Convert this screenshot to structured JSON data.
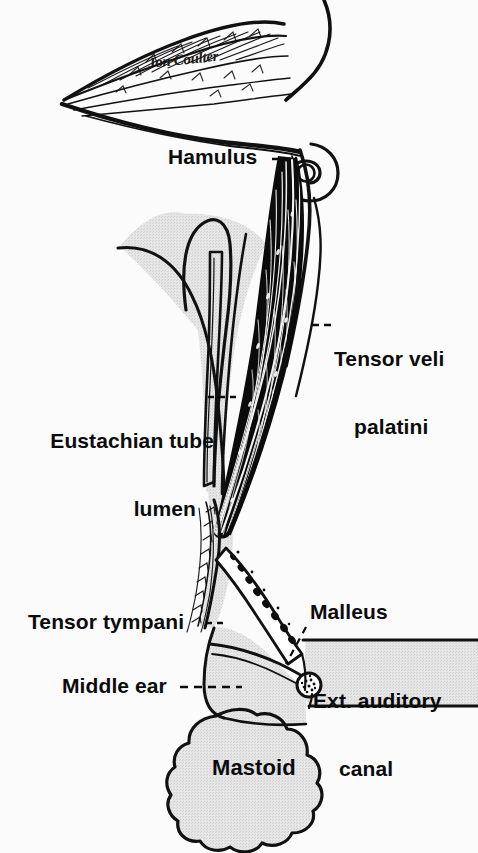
{
  "figure": {
    "signature": "Jon Coulter",
    "background_color": "#fbfbfb",
    "ink_color": "#0b0b0b",
    "shade_color": "#dcdcdc"
  },
  "labels": {
    "hamulus": "Hamulus",
    "tensor_veli_line1": "Tensor veli",
    "tensor_veli_line2": "palatini",
    "eustachian_line1": "Eustachian tube",
    "eustachian_line2": "lumen",
    "tensor_tympani": "Tensor tympani",
    "malleus": "Malleus",
    "ext_auditory_line1": "Ext. auditory",
    "ext_auditory_line2": "canal",
    "middle_ear": "Middle ear",
    "mastoid": "Mastoid"
  }
}
